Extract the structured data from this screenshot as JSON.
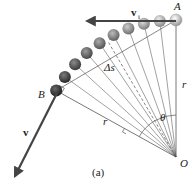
{
  "figure": {
    "caption": "(a)",
    "labels": {
      "point_a": "A",
      "point_b": "B",
      "origin": "O",
      "radius_right": "r",
      "radius_lower": "r",
      "arc_length": "Δs",
      "angle": "θ",
      "velocity_initial": "v",
      "velocity_initial_subscript": "i",
      "velocity_final": "v"
    },
    "ball_count": 10,
    "colors": {
      "line": "#555555",
      "arrow": "#444444",
      "ball_light": "#d8d8d8",
      "ball_dark": "#3a3a3a"
    }
  }
}
